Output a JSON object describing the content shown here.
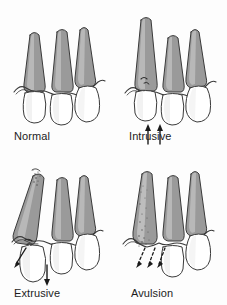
{
  "figure": {
    "background_color": "#fdfdfd",
    "layout": "2x2 grid of line illustrations",
    "width": 227,
    "height": 305
  },
  "style": {
    "root_fill": "#9a9a9a",
    "root_fill_light": "#c9c9c9",
    "crown_fill": "#ffffff",
    "crown_shade": "#f0f0f0",
    "outline_color": "#3a3a3a",
    "gum_fill": "#ffffff",
    "socket_stipple": "#8e8e8e",
    "arrow_color": "#1a1a1a",
    "label_color": "#1c1c1c"
  },
  "panels": [
    {
      "id": "normal",
      "label": "Normal",
      "description": "Three teeth in correct alignment within the alveolar bone, intact gingival line",
      "arrows": [],
      "tooth_count": 3,
      "affected_tooth": "none"
    },
    {
      "id": "intrusive",
      "label": "Intrusive",
      "description": "Left tooth driven apically upward into the socket, crown appears shortened, bone fracture at gingival margin",
      "arrows": [
        {
          "direction": "up",
          "style": "solid",
          "x": 148,
          "y": 112,
          "length": 16
        },
        {
          "direction": "up",
          "style": "solid",
          "x": 160,
          "y": 112,
          "length": 16
        }
      ],
      "tooth_count": 3,
      "affected_tooth": "left"
    },
    {
      "id": "extrusive",
      "label": "Extrusive",
      "description": "Left tooth partially displaced out of the socket, root tip exposed and fractured, periodontal ligament torn",
      "arrows": [
        {
          "direction": "down-left",
          "style": "solid",
          "x": 20,
          "y": 236,
          "length": 16
        },
        {
          "direction": "down",
          "style": "solid",
          "x": 47,
          "y": 265,
          "length": 17
        }
      ],
      "tooth_count": 3,
      "affected_tooth": "left"
    },
    {
      "id": "avulsion",
      "label": "Avulsion",
      "description": "Left tooth completely knocked out, empty socket shown with stippled clot, tooth absent",
      "arrows": [
        {
          "direction": "down-left",
          "style": "dashed",
          "x": 140,
          "y": 248,
          "length": 18
        },
        {
          "direction": "down-left",
          "style": "dashed",
          "x": 152,
          "y": 248,
          "length": 18
        },
        {
          "direction": "down-left",
          "style": "dashed",
          "x": 164,
          "y": 248,
          "length": 18
        }
      ],
      "tooth_count": 2,
      "affected_tooth": "left"
    }
  ]
}
